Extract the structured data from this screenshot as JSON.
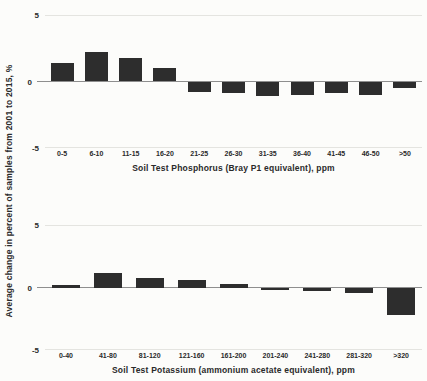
{
  "figure": {
    "y_axis_label": "Average change in percent of samples from 2001 to 2015, %"
  },
  "chart_data": [
    {
      "type": "bar",
      "title": "",
      "xlabel": "Soil Test Phosphorus (Bray P1 equivalent), ppm",
      "ylabel": "Average change in percent of samples from 2001 to 2015, %",
      "categories": [
        "0-5",
        "6-10",
        "11-15",
        "16-20",
        "21-25",
        "26-30",
        "31-35",
        "36-40",
        "41-45",
        "46-50",
        ">50"
      ],
      "values": [
        1.4,
        2.2,
        1.8,
        1.0,
        -0.8,
        -0.9,
        -1.1,
        -1.0,
        -0.9,
        -1.0,
        -0.5
      ],
      "ylim": [
        -5,
        5
      ],
      "yticks": [
        5,
        0,
        -5
      ],
      "grid": "off",
      "legend": "none",
      "bar_color": "#2d2d2d"
    },
    {
      "type": "bar",
      "title": "",
      "xlabel": "Soil Test Potassium (ammonium acetate equivalent), ppm",
      "ylabel": "Average change in percent of samples from 2001 to 2015, %",
      "categories": [
        "0-40",
        "41-80",
        "81-120",
        "121-160",
        "161-200",
        "201-240",
        "241-280",
        "281-320",
        ">320"
      ],
      "values": [
        0.2,
        1.2,
        0.8,
        0.6,
        0.3,
        -0.2,
        -0.3,
        -0.4,
        -2.2
      ],
      "ylim": [
        -5,
        5
      ],
      "yticks": [
        5,
        0,
        -5
      ],
      "grid": "off",
      "legend": "none",
      "bar_color": "#2d2d2d"
    }
  ]
}
